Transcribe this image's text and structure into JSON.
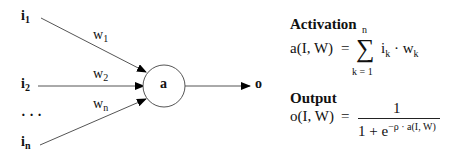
{
  "diagram": {
    "inputs": [
      {
        "label": "i",
        "sub": "1"
      },
      {
        "label": "i",
        "sub": "2"
      },
      {
        "label": "i",
        "sub": "n"
      }
    ],
    "ellipsis": "· · ·",
    "weights": [
      {
        "label": "w",
        "sub": "1"
      },
      {
        "label": "w",
        "sub": "2"
      },
      {
        "label": "w",
        "sub": "n"
      }
    ],
    "node_label": "a",
    "output_label": "o",
    "colors": {
      "line": "#555555",
      "arrowhead": "#000000",
      "node_stroke": "#555555"
    }
  },
  "activation": {
    "heading": "Activation",
    "lhs": "a(I, W)",
    "equals": "=",
    "sum_upper": "n",
    "sum_symbol": "∑",
    "sum_lower": "k = 1",
    "term_i": "i",
    "term_i_sub": "k",
    "dot": "·",
    "term_w": "w",
    "term_w_sub": "k"
  },
  "output": {
    "heading": "Output",
    "lhs": "o(I, W)",
    "equals": "=",
    "numerator": "1",
    "denominator_base": "1 + e",
    "denominator_exp": "−ρ · a(I, W)"
  }
}
